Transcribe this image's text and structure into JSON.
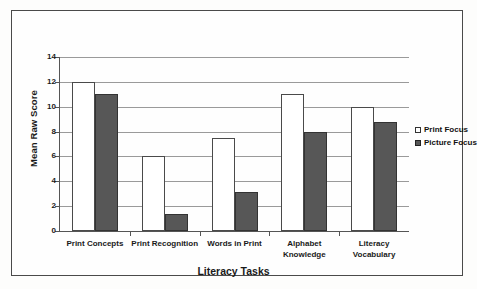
{
  "chart_data": {
    "type": "bar",
    "title": "",
    "xlabel": "Literacy Tasks",
    "ylabel": "Mean Raw Score",
    "ylim": [
      0,
      14
    ],
    "yticks": [
      0,
      2,
      4,
      6,
      8,
      10,
      12,
      14
    ],
    "grid": true,
    "legend_position": "right",
    "categories": [
      "Print Concepts",
      "Print Recognition",
      "Words in Print",
      "Alphabet Knowledge",
      "Literacy Vocabulary"
    ],
    "series": [
      {
        "name": "Print Focus",
        "color": "#ffffff",
        "values": [
          12,
          6,
          7.5,
          11,
          10
        ]
      },
      {
        "name": "Picture Focus",
        "color": "#575757",
        "values": [
          11,
          1.4,
          3.1,
          8,
          8.8
        ]
      }
    ]
  },
  "axis": {
    "y_title": "Mean Raw Score",
    "x_title": "Literacy Tasks",
    "y_tick_labels": [
      "0",
      "2",
      "4",
      "6",
      "8",
      "10",
      "12",
      "14"
    ],
    "x_tick_labels": [
      "Print Concepts",
      "Print Recognition",
      "Words in Print",
      "Alphabet Knowledge",
      "Literacy Vocabulary"
    ]
  },
  "legend": {
    "items": [
      {
        "label": "Print Focus"
      },
      {
        "label": "Picture Focus"
      }
    ]
  }
}
